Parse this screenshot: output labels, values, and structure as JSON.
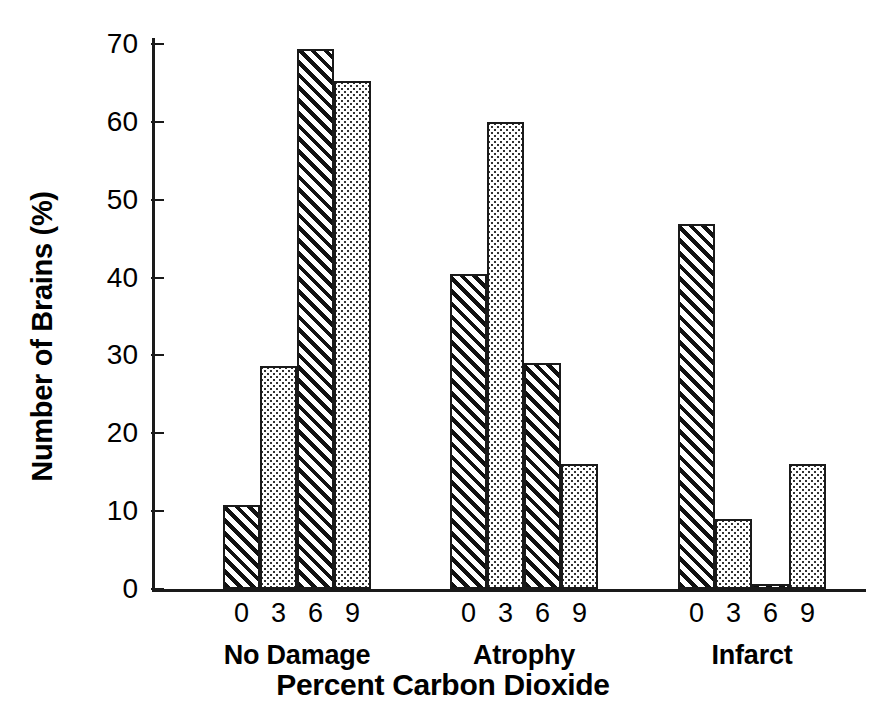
{
  "chart_data": {
    "type": "bar",
    "title": "",
    "xlabel": "Percent Carbon Dioxide",
    "ylabel": "Number of Brains (%)",
    "ylim": [
      0,
      70
    ],
    "yticks": [
      0,
      10,
      20,
      30,
      40,
      50,
      60,
      70
    ],
    "grid": false,
    "legend": "none",
    "x_tick_labels": [
      "0",
      "3",
      "6",
      "9"
    ],
    "groups": [
      "No Damage",
      "Atrophy",
      "Infarct"
    ],
    "series": [
      {
        "name": "0",
        "fill": "hatch",
        "values": [
          10.8,
          40.4,
          46.9
        ]
      },
      {
        "name": "3",
        "fill": "stipple",
        "values": [
          28.7,
          60.0,
          9.0
        ]
      },
      {
        "name": "6",
        "fill": "hatch",
        "values": [
          69.4,
          29.0,
          0.5
        ]
      },
      {
        "name": "9",
        "fill": "stipple",
        "values": [
          65.2,
          16.1,
          16.0
        ]
      }
    ],
    "bars": [
      {
        "group": "No Damage",
        "category": "0",
        "value": 10.8,
        "fill": "hatch"
      },
      {
        "group": "No Damage",
        "category": "3",
        "value": 28.7,
        "fill": "stipple"
      },
      {
        "group": "No Damage",
        "category": "6",
        "value": 69.4,
        "fill": "hatch"
      },
      {
        "group": "No Damage",
        "category": "9",
        "value": 65.2,
        "fill": "stipple"
      },
      {
        "group": "Atrophy",
        "category": "0",
        "value": 40.4,
        "fill": "hatch"
      },
      {
        "group": "Atrophy",
        "category": "3",
        "value": 60.0,
        "fill": "stipple"
      },
      {
        "group": "Atrophy",
        "category": "6",
        "value": 29.0,
        "fill": "hatch"
      },
      {
        "group": "Atrophy",
        "category": "9",
        "value": 16.1,
        "fill": "stipple"
      },
      {
        "group": "Infarct",
        "category": "0",
        "value": 46.9,
        "fill": "hatch"
      },
      {
        "group": "Infarct",
        "category": "3",
        "value": 9.0,
        "fill": "stipple"
      },
      {
        "group": "Infarct",
        "category": "6",
        "value": 0.5,
        "fill": "hatch"
      },
      {
        "group": "Infarct",
        "category": "9",
        "value": 16.0,
        "fill": "stipple"
      }
    ],
    "colors": {
      "axis": "#1a1a1a",
      "text": "#000000",
      "background": "#ffffff",
      "hatch_stroke": "#111111",
      "stipple_dot": "#333333"
    }
  },
  "axis": {
    "y_tick_0": "0",
    "y_tick_10": "10",
    "y_tick_20": "20",
    "y_tick_30": "30",
    "y_tick_40": "40",
    "y_tick_50": "50",
    "y_tick_60": "60",
    "y_tick_70": "70"
  }
}
